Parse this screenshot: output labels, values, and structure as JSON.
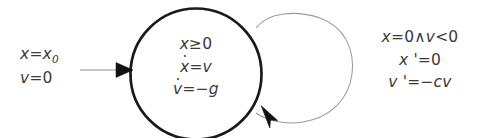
{
  "diagram": {
    "kind": "hybrid-automaton-bouncing-ball",
    "colors": {
      "background": "#ffffff",
      "mode_stroke": "#1a1a1a",
      "loop_stroke": "#9a9a9a",
      "arrow_line": "#8d8d8d",
      "arrow_head": "#111111",
      "text": "#3a3a3a"
    },
    "init_label": {
      "name": "initial-condition",
      "line1": {
        "lhs": "x",
        "rel": "=",
        "rhs": "x",
        "rhs_sub": "0"
      },
      "line2": {
        "lhs": "v",
        "rel": "=",
        "rhs": "0"
      },
      "plain": "x = x0 ; v = 0"
    },
    "mode_label": {
      "name": "mode-invariant-and-flow",
      "invariant": {
        "lhs": "x",
        "rel": "≥",
        "rhs": "0"
      },
      "flow1": {
        "lhs": "x",
        "dot": true,
        "rel": "=",
        "rhs": "v"
      },
      "flow2": {
        "lhs": "v",
        "dot": true,
        "rel": "=",
        "rhs": "−g"
      },
      "plain": "x ≥ 0 ; ẋ = v ; v̇ = −g"
    },
    "jump_label": {
      "name": "guard-and-reset",
      "guard": {
        "lhs": "x",
        "rel": "=",
        "rhs": "0",
        "conj": "∧",
        "lhs2": "v",
        "rel2": "<",
        "rhs2": "0"
      },
      "reset1": {
        "lhs": "x '",
        "rel": "=",
        "rhs": "0"
      },
      "reset2": {
        "lhs": "v '",
        "rel": "=",
        "rhs": "−cv"
      },
      "plain": "x = 0 ∧ v < 0 ; x' = 0 ; v' = −cv"
    },
    "shapes": {
      "mode_circle": {
        "cx": 196,
        "cy": 74,
        "r": 65.5,
        "stroke_width": 2.6
      },
      "self_loop": {
        "cx": 301,
        "cy": 70,
        "rx": 51,
        "ry": 56,
        "stroke_width": 1.0
      },
      "init_arrow": {
        "x1": 80,
        "y1": 70,
        "x2": 131,
        "y2": 70
      }
    }
  }
}
